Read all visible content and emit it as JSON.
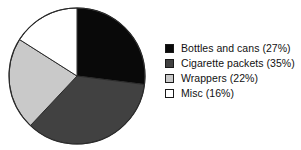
{
  "chart_data": {
    "type": "pie",
    "title": "",
    "subtitle": "",
    "xlabel": "",
    "ylabel": "",
    "grid": false,
    "legend_position": "right",
    "start_angle_deg": 0,
    "direction": "clockwise",
    "categories": [
      "Bottles and cans",
      "Cigarette packets",
      "Wrappers",
      "Misc"
    ],
    "values": [
      27,
      35,
      22,
      16
    ],
    "value_unit": "%",
    "colors": [
      "#090909",
      "#414141",
      "#c9c9c9",
      "#ffffff"
    ],
    "slices": [
      {
        "label": "Bottles and cans",
        "value": 27,
        "legend_text": "Bottles and cans (27%)",
        "color": "#090909",
        "start_deg": 0,
        "end_deg": 97.2
      },
      {
        "label": "Cigarette packets",
        "value": 35,
        "legend_text": "Cigarette packets (35%)",
        "color": "#414141",
        "start_deg": 97.2,
        "end_deg": 223.2
      },
      {
        "label": "Wrappers",
        "value": 22,
        "legend_text": "Wrappers (22%)",
        "color": "#c9c9c9",
        "start_deg": 223.2,
        "end_deg": 302.4
      },
      {
        "label": "Misc",
        "value": 16,
        "legend_text": "Misc (16%)",
        "color": "#ffffff",
        "start_deg": 302.4,
        "end_deg": 360
      }
    ],
    "geometry": {
      "center_x": 77,
      "center_y": 76,
      "radius": 68,
      "outline_color": "#2b2b2b",
      "outline_width": 1
    }
  },
  "legend": {
    "items": [
      {
        "text": "Bottles and cans (27%)",
        "swatch_color": "#090909"
      },
      {
        "text": "Cigarette packets (35%)",
        "swatch_color": "#414141"
      },
      {
        "text": "Wrappers (22%)",
        "swatch_color": "#c9c9c9"
      },
      {
        "text": "Misc (16%)",
        "swatch_color": "#ffffff"
      }
    ]
  },
  "background_color": "#ffffff"
}
